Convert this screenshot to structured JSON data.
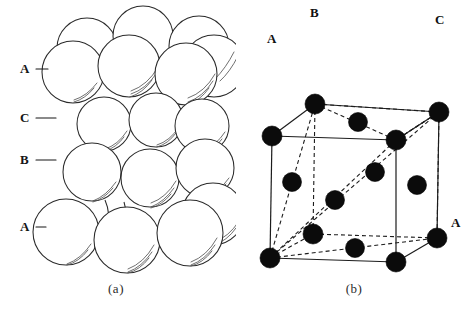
{
  "figure": {
    "background_color": "#ffffff",
    "ink_color": "#1a1a1a"
  },
  "panel_a": {
    "caption": "(a)",
    "description": "Hard-sphere stacking model of close-packed layers in ABCA sequence",
    "sphere_fill": "#ffffff",
    "sphere_outline": "#2a2a2a",
    "layer_labels": [
      {
        "text": "A",
        "x": 22,
        "y": 64,
        "leader_x1": 36,
        "leader_y1": 69,
        "leader_x2": 48,
        "leader_y2": 69
      },
      {
        "text": "C",
        "x": 22,
        "y": 113,
        "leader_x1": 36,
        "leader_y1": 118,
        "leader_x2": 56,
        "leader_y2": 118
      },
      {
        "text": "B",
        "x": 22,
        "y": 155,
        "leader_x1": 36,
        "leader_y1": 160,
        "leader_x2": 56,
        "leader_y2": 160
      },
      {
        "text": "A",
        "x": 22,
        "y": 222,
        "leader_x1": 36,
        "leader_y1": 227,
        "leader_x2": 46,
        "leader_y2": 227
      }
    ],
    "layers": [
      {
        "name": "A-top-back",
        "label": "A",
        "radius": 30,
        "spheres": [
          {
            "cx": 87,
            "cy": 48
          },
          {
            "cx": 143,
            "cy": 36
          },
          {
            "cx": 199,
            "cy": 46
          }
        ]
      },
      {
        "name": "A-top-front",
        "label": "A",
        "radius": 31,
        "spheres": [
          {
            "cx": 73,
            "cy": 72
          },
          {
            "cx": 129,
            "cy": 66
          },
          {
            "cx": 186,
            "cy": 74
          },
          {
            "cx": 214,
            "cy": 66
          }
        ]
      },
      {
        "name": "C",
        "label": "C",
        "radius": 27,
        "spheres": [
          {
            "cx": 104,
            "cy": 124
          },
          {
            "cx": 156,
            "cy": 120
          },
          {
            "cx": 200,
            "cy": 126
          }
        ]
      },
      {
        "name": "B",
        "label": "B",
        "radius": 29,
        "spheres": [
          {
            "cx": 92,
            "cy": 172
          },
          {
            "cx": 150,
            "cy": 178
          },
          {
            "cx": 203,
            "cy": 168
          }
        ]
      },
      {
        "name": "A-bottom",
        "label": "A",
        "radius": 33,
        "spheres": [
          {
            "cx": 66,
            "cy": 232
          },
          {
            "cx": 127,
            "cy": 240
          },
          {
            "cx": 190,
            "cy": 233
          },
          {
            "cx": 213,
            "cy": 214
          }
        ]
      }
    ]
  },
  "panel_b": {
    "caption": "(b)",
    "description": "Face-centred cubic unit cell with close-packed (111) planes marked A, B, C",
    "atom_color": "#0b0b0b",
    "edge_color": "#1c1c1c",
    "atom_radius": 9,
    "vertex_labels": [
      {
        "text": "A",
        "x": 33,
        "y": 38
      },
      {
        "text": "B",
        "x": 76,
        "y": 12
      },
      {
        "text": "C",
        "x": 200,
        "y": 18
      },
      {
        "text": "A",
        "x": 216,
        "y": 122
      }
    ],
    "cube": {
      "front_top_left": {
        "x": 36,
        "y": 136
      },
      "front_top_right": {
        "x": 160,
        "y": 140
      },
      "front_bottom_left": {
        "x": 34,
        "y": 258
      },
      "front_bottom_right": {
        "x": 160,
        "y": 262
      },
      "back_top_left": {
        "x": 79,
        "y": 104
      },
      "back_top_right": {
        "x": 203,
        "y": 112
      },
      "back_bottom_left": {
        "x": 77,
        "y": 234
      },
      "back_bottom_right": {
        "x": 201,
        "y": 238
      }
    },
    "corner_atoms": [
      {
        "name": "front-top-left-A",
        "x": 36,
        "y": 136
      },
      {
        "name": "front-top-right",
        "x": 160,
        "y": 140
      },
      {
        "name": "front-bottom-left",
        "x": 34,
        "y": 258
      },
      {
        "name": "front-bottom-right",
        "x": 160,
        "y": 262
      },
      {
        "name": "back-top-left-B",
        "x": 79,
        "y": 104
      },
      {
        "name": "back-top-right-C",
        "x": 203,
        "y": 112
      },
      {
        "name": "back-bottom-left",
        "x": 77,
        "y": 234
      },
      {
        "name": "back-bottom-right-A",
        "x": 201,
        "y": 238
      }
    ],
    "face_center_atoms": [
      {
        "name": "top-face-center",
        "x": 122,
        "y": 122
      },
      {
        "name": "bottom-face-center",
        "x": 119,
        "y": 248
      },
      {
        "name": "left-face-center",
        "x": 56,
        "y": 182
      },
      {
        "name": "right-face-center",
        "x": 181,
        "y": 185
      },
      {
        "name": "front-face-center",
        "x": 99,
        "y": 200
      },
      {
        "name": "back-face-center",
        "x": 139,
        "y": 172
      }
    ],
    "close_packed_triangles": [
      {
        "name": "plane-upper",
        "vertices": [
          [
            79,
            104
          ],
          [
            160,
            140
          ],
          [
            203,
            112
          ]
        ],
        "style": "dashed"
      },
      {
        "name": "plane-lower",
        "vertices": [
          [
            34,
            258
          ],
          [
            160,
            140
          ],
          [
            203,
            112
          ]
        ],
        "style": "dashed"
      }
    ]
  }
}
